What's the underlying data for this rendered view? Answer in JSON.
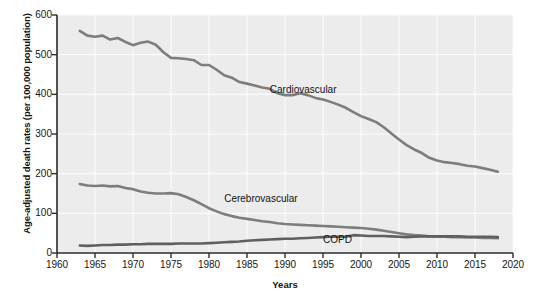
{
  "chart_data": {
    "type": "line",
    "title": "",
    "xlabel": "Years",
    "ylabel": "Age-adjusted death rates (per 100,000 population)",
    "xlim": [
      1960,
      2020
    ],
    "ylim": [
      0,
      600
    ],
    "xticks": [
      1960,
      1965,
      1970,
      1975,
      1980,
      1985,
      1990,
      1995,
      2000,
      2005,
      2010,
      2015,
      2020
    ],
    "yticks": [
      0,
      100,
      200,
      300,
      400,
      500,
      600
    ],
    "grid": true,
    "legend_position": "inline-annotations",
    "line_color": "#7d7d7d",
    "series": [
      {
        "name": "Cardiovascular",
        "color": "#7d7d7d",
        "label_x": 1988,
        "label_y": 412,
        "x": [
          1963,
          1964,
          1965,
          1966,
          1967,
          1968,
          1969,
          1970,
          1971,
          1972,
          1973,
          1974,
          1975,
          1976,
          1977,
          1978,
          1979,
          1980,
          1981,
          1982,
          1983,
          1984,
          1985,
          1986,
          1987,
          1988,
          1989,
          1990,
          1991,
          1992,
          1993,
          1994,
          1995,
          1996,
          1997,
          1998,
          1999,
          2000,
          2001,
          2002,
          2003,
          2004,
          2005,
          2006,
          2007,
          2008,
          2009,
          2010,
          2011,
          2012,
          2013,
          2014,
          2015,
          2016,
          2017,
          2018
        ],
        "values": [
          560,
          548,
          545,
          548,
          538,
          542,
          532,
          524,
          530,
          533,
          525,
          506,
          492,
          491,
          489,
          486,
          474,
          474,
          462,
          448,
          442,
          431,
          427,
          422,
          417,
          414,
          403,
          398,
          398,
          403,
          398,
          391,
          387,
          381,
          374,
          366,
          355,
          345,
          338,
          330,
          317,
          301,
          286,
          272,
          261,
          252,
          240,
          233,
          229,
          227,
          224,
          220,
          218,
          214,
          210,
          205
        ]
      },
      {
        "name": "Cerebrovascular",
        "color": "#7d7d7d",
        "label_x": 1982,
        "label_y": 135,
        "x": [
          1963,
          1964,
          1965,
          1966,
          1967,
          1968,
          1969,
          1970,
          1971,
          1972,
          1973,
          1974,
          1975,
          1976,
          1977,
          1978,
          1979,
          1980,
          1981,
          1982,
          1983,
          1984,
          1985,
          1986,
          1987,
          1988,
          1989,
          1990,
          1991,
          1992,
          1993,
          1994,
          1995,
          1996,
          1997,
          1998,
          1999,
          2000,
          2001,
          2002,
          2003,
          2004,
          2005,
          2006,
          2007,
          2008,
          2009,
          2010,
          2011,
          2012,
          2013,
          2014,
          2015,
          2016,
          2017,
          2018
        ],
        "values": [
          174,
          170,
          169,
          170,
          168,
          169,
          164,
          161,
          155,
          152,
          150,
          150,
          151,
          148,
          141,
          133,
          123,
          113,
          105,
          98,
          93,
          89,
          86,
          83,
          80,
          78,
          75,
          73,
          72,
          71,
          70,
          69,
          68,
          67,
          66,
          65,
          64,
          63,
          61,
          59,
          56,
          53,
          50,
          47,
          45,
          44,
          42,
          42,
          41,
          40,
          40,
          39,
          39,
          38,
          38,
          37
        ]
      },
      {
        "name": "COPD",
        "color": "#5f5f5f",
        "label_x": 1995,
        "label_y": 32,
        "x": [
          1963,
          1964,
          1965,
          1966,
          1967,
          1968,
          1969,
          1970,
          1971,
          1972,
          1973,
          1974,
          1975,
          1976,
          1977,
          1978,
          1979,
          1980,
          1981,
          1982,
          1983,
          1984,
          1985,
          1986,
          1987,
          1988,
          1989,
          1990,
          1991,
          1992,
          1993,
          1994,
          1995,
          1996,
          1997,
          1998,
          1999,
          2000,
          2001,
          2002,
          2003,
          2004,
          2005,
          2006,
          2007,
          2008,
          2009,
          2010,
          2011,
          2012,
          2013,
          2014,
          2015,
          2016,
          2017,
          2018
        ],
        "values": [
          19,
          18,
          19,
          20,
          20,
          21,
          21,
          22,
          22,
          23,
          23,
          23,
          23,
          24,
          24,
          24,
          24,
          25,
          26,
          27,
          28,
          29,
          31,
          32,
          33,
          34,
          35,
          36,
          36,
          37,
          38,
          39,
          40,
          41,
          41,
          41,
          45,
          44,
          43,
          43,
          43,
          42,
          41,
          40,
          41,
          42,
          42,
          42,
          42,
          42,
          42,
          41,
          41,
          41,
          41,
          40
        ]
      }
    ]
  }
}
